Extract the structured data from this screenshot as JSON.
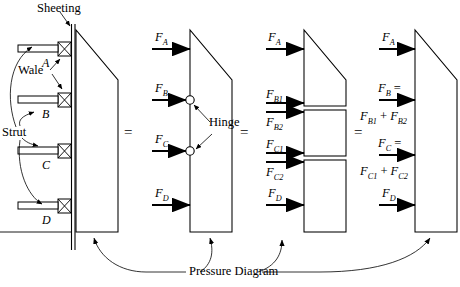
{
  "figure": {
    "type": "engineering-diagram",
    "equals_signs": [
      "=",
      "=",
      "="
    ]
  },
  "annotations": {
    "sheeting": "Sheeting",
    "wale": "Wale",
    "strut": "Strut",
    "hinge": "Hinge",
    "pressure_diagram": "Pressure Diagram"
  },
  "panel1": {
    "name": "braced-sheeting-section",
    "strut_levels": [
      "A",
      "B",
      "C",
      "D"
    ],
    "wale_marker": "X"
  },
  "panel2": {
    "name": "continuous-beam-free-body",
    "forces": [
      {
        "label": "F",
        "sub": "A"
      },
      {
        "label": "F",
        "sub": "B"
      },
      {
        "label": "F",
        "sub": "C"
      },
      {
        "label": "F",
        "sub": "D"
      }
    ],
    "hinge_label": "Hinge",
    "hinge_count": 2
  },
  "panel3": {
    "name": "simple-beam-segments-free-body",
    "forces": [
      {
        "label": "F",
        "sub": "A"
      },
      {
        "label": "F",
        "sub": "B1"
      },
      {
        "label": "F",
        "sub": "B2"
      },
      {
        "label": "F",
        "sub": "C1"
      },
      {
        "label": "F",
        "sub": "C2"
      },
      {
        "label": "F",
        "sub": "D"
      }
    ]
  },
  "panel4": {
    "name": "resultant-strut-loads",
    "forces": [
      {
        "line1_label": "F",
        "line1_sub": "A",
        "line2": ""
      },
      {
        "line1_label": "F",
        "line1_sub": "B",
        "line1_suffix": " =",
        "line2_a": "F",
        "line2_a_sub": "B1",
        "line2_plus": " + ",
        "line2_b": "F",
        "line2_b_sub": "B2"
      },
      {
        "line1_label": "F",
        "line1_sub": "C",
        "line1_suffix": " =",
        "line2_a": "F",
        "line2_a_sub": "C1",
        "line2_plus": " + ",
        "line2_b": "F",
        "line2_b_sub": "C2"
      },
      {
        "line1_label": "F",
        "line1_sub": "D",
        "line2": ""
      }
    ]
  }
}
